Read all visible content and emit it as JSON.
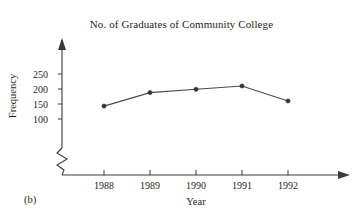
{
  "figure": {
    "panel_label": "(b)",
    "background": "#ffffff",
    "ink_color": "#3a3a3a",
    "marker_color": "#33333b"
  },
  "chart_data": {
    "type": "line",
    "title": "No. of Graduates of Community College",
    "xlabel": "Year",
    "ylabel": "Frequency",
    "categories": [
      "1988",
      "1989",
      "1990",
      "1991",
      "1992"
    ],
    "values": [
      143,
      188,
      199,
      210,
      160
    ],
    "yticks": [
      "250",
      "200",
      "150",
      "100"
    ],
    "ytick_values": [
      250,
      200,
      150,
      100
    ],
    "ylim": [
      100,
      250
    ],
    "y_axis_break": true,
    "grid": false,
    "legend": null,
    "markers": "filled-circle",
    "axis_arrows": true
  }
}
